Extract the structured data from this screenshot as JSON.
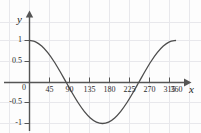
{
  "chart_data": {
    "type": "line",
    "title": "",
    "xlabel": "x",
    "ylabel": "y",
    "function": "y = cos(x)",
    "grid": true,
    "legend": null,
    "xlim": [
      -15,
      390
    ],
    "ylim": [
      -1.35,
      1.35
    ],
    "x_ticks": [
      45,
      90,
      135,
      180,
      225,
      270,
      315,
      360
    ],
    "x_tick_labels": [
      "45",
      "90",
      "135",
      "180",
      "225",
      "270",
      "315",
      "360"
    ],
    "y_ticks": [
      1,
      0.5,
      0,
      -0.5,
      -1
    ],
    "y_tick_labels": [
      "1",
      "0.5",
      "0",
      "-0.5",
      "-1"
    ],
    "x": [
      0,
      15,
      30,
      45,
      60,
      75,
      90,
      105,
      120,
      135,
      150,
      165,
      180,
      195,
      210,
      225,
      240,
      255,
      270,
      285,
      300,
      315,
      330,
      345,
      360
    ],
    "values": [
      1,
      0.966,
      0.866,
      0.707,
      0.5,
      0.259,
      0,
      -0.259,
      -0.5,
      -0.707,
      -0.866,
      -0.966,
      -1,
      -0.966,
      -0.866,
      -0.707,
      -0.5,
      -0.259,
      0,
      0.259,
      0.5,
      0.707,
      0.866,
      0.966,
      1
    ],
    "zero_crossings": [
      90,
      270
    ],
    "maxima": [
      {
        "x": 0,
        "y": 1
      },
      {
        "x": 360,
        "y": 1
      }
    ],
    "minima": [
      {
        "x": 180,
        "y": -1
      }
    ],
    "colors": {
      "curve": "#4d4d4d",
      "axis": "#555555",
      "grid": "#e8e8ec",
      "text": "#2b2b2b",
      "background": "#fdfdfd"
    }
  }
}
